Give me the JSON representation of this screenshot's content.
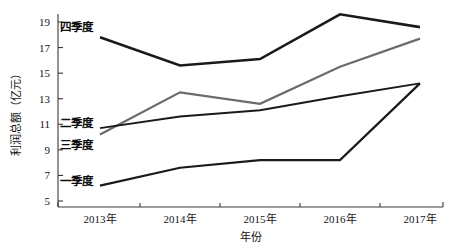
{
  "chart_data": {
    "type": "line",
    "title": "",
    "xlabel": "年份",
    "ylabel": "利润总额（亿元）",
    "categories": [
      "2013年",
      "2014年",
      "2015年",
      "2016年",
      "2017年"
    ],
    "x_tick_labels": [
      "2013年",
      "2014年",
      "2015年",
      "2016年",
      "2017年"
    ],
    "y_tick_labels": [
      "5",
      "7",
      "9",
      "11",
      "13",
      "15",
      "17",
      "19"
    ],
    "y_ticks": [
      5,
      7,
      9,
      11,
      13,
      15,
      17,
      19
    ],
    "ylim": [
      5,
      20
    ],
    "xlim": [
      2013,
      2017
    ],
    "grid": false,
    "legend_position": "inline-labels-left",
    "series": [
      {
        "name": "四季度",
        "label": "四季度",
        "color": "#1a1a1a",
        "width": 2.6,
        "values": [
          17.8,
          15.6,
          16.1,
          19.6,
          18.6
        ],
        "label_x": 2013.0,
        "label_y": 18.6
      },
      {
        "name": "三季度",
        "label": "三季度",
        "color": "#6b6b6b",
        "width": 2.2,
        "values": [
          10.2,
          13.5,
          12.6,
          15.5,
          17.7
        ],
        "label_x": 2013.0,
        "label_y": 9.4
      },
      {
        "name": "二季度",
        "label": "二季度",
        "color": "#1a1a1a",
        "width": 2.0,
        "values": [
          10.7,
          11.6,
          12.1,
          13.2,
          14.2
        ],
        "label_x": 2013.0,
        "label_y": 11.1
      },
      {
        "name": "一季度",
        "label": "一季度",
        "color": "#1a1a1a",
        "width": 2.2,
        "values": [
          6.2,
          7.6,
          8.2,
          8.2,
          14.2
        ],
        "label_x": 2013.0,
        "label_y": 6.6
      }
    ],
    "colors": {
      "axis": "#3a3a3a",
      "text": "#111111",
      "series_dark": "#1a1a1a",
      "series_gray": "#6b6b6b",
      "background": "#ffffff"
    }
  }
}
